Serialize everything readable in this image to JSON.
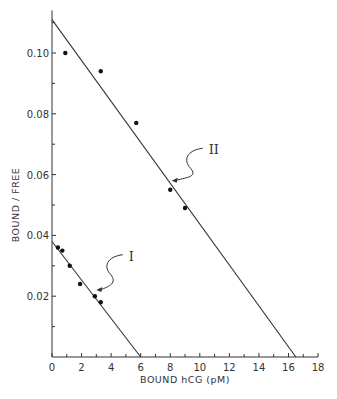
{
  "chart_data": {
    "type": "scatter",
    "title": "",
    "xlabel": "BOUND hCG (pM)",
    "ylabel": "BOUND / FREE",
    "xlim": [
      0,
      18
    ],
    "ylim": [
      0,
      0.112
    ],
    "x_ticks": [
      0,
      2,
      4,
      6,
      8,
      10,
      12,
      14,
      16,
      18
    ],
    "y_ticks": [
      0.02,
      0.04,
      0.06,
      0.08,
      0.1
    ],
    "x_tick_labels": [
      "0",
      "2",
      "4",
      "6",
      "8",
      "10",
      "12",
      "14",
      "16",
      "18"
    ],
    "y_tick_labels": [
      "0.02",
      "0.04",
      "0.06",
      "0.08",
      "0.10"
    ],
    "grid": false,
    "legend": "none",
    "series": [
      {
        "name": "I",
        "points": [
          [
            0.4,
            0.036
          ],
          [
            0.7,
            0.035
          ],
          [
            1.2,
            0.03
          ],
          [
            1.9,
            0.024
          ],
          [
            2.9,
            0.02
          ],
          [
            3.3,
            0.018
          ]
        ],
        "fit_line": [
          [
            0,
            0.038
          ],
          [
            6.0,
            0
          ]
        ]
      },
      {
        "name": "II",
        "points": [
          [
            0.9,
            0.1
          ],
          [
            3.3,
            0.094
          ],
          [
            5.7,
            0.077
          ],
          [
            8.0,
            0.055
          ],
          [
            9.0,
            0.049
          ]
        ],
        "fit_line": [
          [
            0,
            0.111
          ],
          [
            16.5,
            0
          ]
        ]
      }
    ],
    "annotations": [
      {
        "text": "I",
        "points_to_series": "I",
        "label_at": [
          5.2,
          0.033
        ],
        "arrow_tip": [
          3.0,
          0.022
        ]
      },
      {
        "text": "II",
        "points_to_series": "II",
        "label_at": [
          10.6,
          0.068
        ],
        "arrow_tip": [
          8.1,
          0.058
        ]
      }
    ]
  }
}
